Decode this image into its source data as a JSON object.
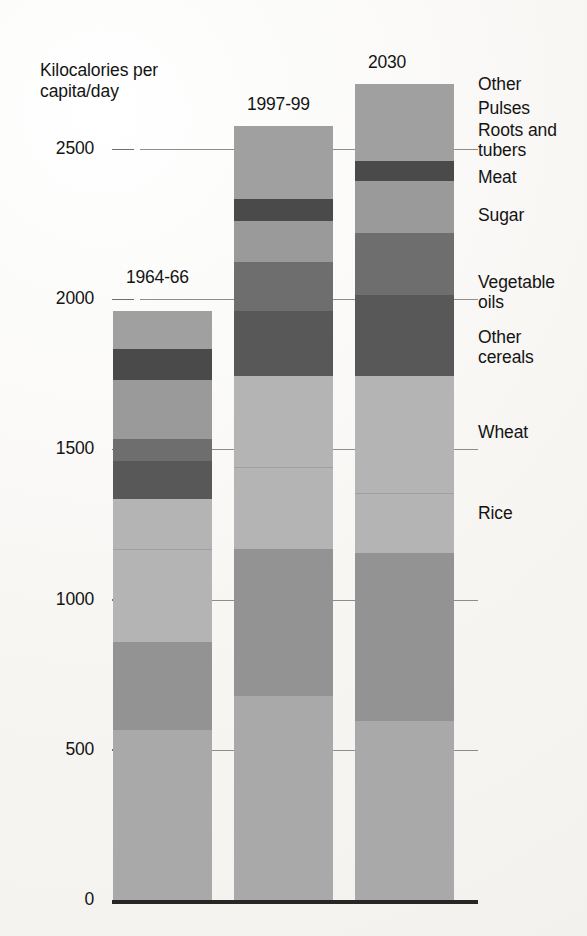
{
  "chart_data": {
    "type": "bar",
    "subtype": "stacked-bar",
    "title": "",
    "ylabel": "Kilocalories per capita/day",
    "xlabel": "",
    "ylim": [
      0,
      2700
    ],
    "yticks": [
      0,
      500,
      1000,
      1500,
      2000,
      2500
    ],
    "ytick_labels": [
      "0",
      "500",
      "1000",
      "1500",
      "2000",
      "2500"
    ],
    "grid": true,
    "legend_position": "right",
    "categories": [
      "1964-66",
      "1997-99",
      "2030"
    ],
    "series": [
      {
        "name": "Rice",
        "values": [
          565,
          680,
          595
        ],
        "color": "#a9a9a9"
      },
      {
        "name": "Wheat",
        "values": [
          295,
          490,
          560
        ],
        "color": "#939393"
      },
      {
        "name": "Other cereals",
        "values": [
          310,
          270,
          200
        ],
        "color": "#b4b4b4"
      },
      {
        "name": "Vegetable oils",
        "values": [
          165,
          305,
          390
        ],
        "color": "#b4b4b4"
      },
      {
        "name": "Sugar",
        "values": [
          125,
          215,
          270
        ],
        "color": "#585858"
      },
      {
        "name": "Meat",
        "values": [
          75,
          165,
          205
        ],
        "color": "#6e6e6e"
      },
      {
        "name": "Roots and tubers",
        "values": [
          195,
          135,
          175
        ],
        "color": "#9a9a9a"
      },
      {
        "name": "Pulses",
        "values": [
          105,
          75,
          65
        ],
        "color": "#4a4a4a"
      },
      {
        "name": "Other",
        "values": [
          125,
          240,
          255
        ],
        "color": "#a0a0a0"
      }
    ],
    "totals": [
      2000,
      2575,
      2715
    ],
    "annotations": []
  },
  "axis": {
    "title_text": "Kilocalories per\ncapita/day",
    "ticks": [
      {
        "label": "2500",
        "value": 2500
      },
      {
        "label": "2000",
        "value": 2000
      },
      {
        "label": "1500",
        "value": 1500
      },
      {
        "label": "1000",
        "value": 1000
      },
      {
        "label": "500",
        "value": 500
      },
      {
        "label": "0",
        "value": 0
      }
    ]
  },
  "bars": [
    {
      "label": "1964-66",
      "total": 2000
    },
    {
      "label": "1997-99",
      "total": 2575
    },
    {
      "label": "2030",
      "total": 2715
    }
  ],
  "legend": {
    "items": [
      {
        "label": "Other"
      },
      {
        "label": "Pulses"
      },
      {
        "label": "Roots and\ntubers"
      },
      {
        "label": "Meat"
      },
      {
        "label": "Sugar"
      },
      {
        "label": "Vegetable\noils"
      },
      {
        "label": "Other\ncereals"
      },
      {
        "label": "Wheat"
      },
      {
        "label": "Rice"
      }
    ]
  },
  "colors": {
    "rice": "#a9a9a9",
    "wheat": "#939393",
    "other_cereals": "#b4b4b4",
    "vegetable_oils": "#b4b4b4",
    "sugar": "#585858",
    "meat": "#6e6e6e",
    "roots_and_tubers": "#9a9a9a",
    "pulses": "#4a4a4a",
    "other": "#a0a0a0",
    "axis": "#141414",
    "gridline": "#8d8d8d",
    "baseline": "#262626"
  }
}
